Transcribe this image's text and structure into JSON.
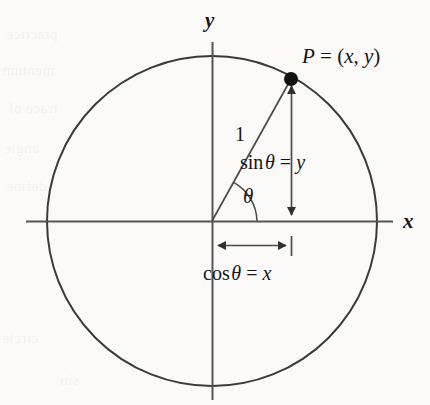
{
  "figure": {
    "background_color": "#fbfaf8",
    "stroke_color": "#3a3a3a",
    "text_color": "#161616",
    "axes": {
      "x_label": "x",
      "y_label": "y"
    },
    "circle": {
      "center_x": 212,
      "center_y": 221,
      "radius": 165
    },
    "point": {
      "label": "P = (x, y)",
      "label_parts": {
        "name": "P",
        "equals": " = (",
        "x": "x",
        "comma": ", ",
        "y": "y",
        "close": ")"
      },
      "cx": 291,
      "cy": 79
    },
    "radius_label": "1",
    "angle_label": "θ",
    "sin_label": {
      "func": "sin",
      "arg": "θ",
      "equals": " = ",
      "value": "y",
      "full": "sin θ = y"
    },
    "cos_label": {
      "func": "cos",
      "arg": "θ",
      "equals": " = ",
      "value": "x",
      "full": "cos θ = x"
    },
    "ghost_text": [
      "practice",
      "mentum",
      "trace of",
      "angle",
      "define",
      "circle",
      "sin"
    ]
  }
}
